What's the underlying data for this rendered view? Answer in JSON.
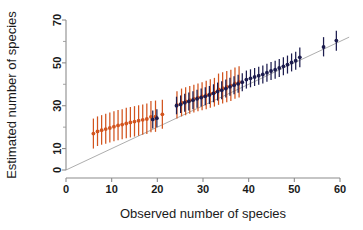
{
  "chart_data": {
    "type": "scatter",
    "title": "",
    "subtitle": "",
    "xlabel": "Observed number of species",
    "ylabel": "Estimated number of species",
    "xlim": [
      0,
      62
    ],
    "ylim": [
      0,
      72
    ],
    "xticks": [
      0,
      10,
      20,
      30,
      40,
      50,
      60
    ],
    "xticklabels": [
      "0",
      "10",
      "20",
      "30",
      "40",
      "50",
      "60"
    ],
    "yticks": [
      0,
      10,
      30,
      50,
      70
    ],
    "yticklabels": [
      "0",
      "10",
      "30",
      "50",
      "70"
    ],
    "yminorticks": [
      20,
      40,
      60
    ],
    "grid": false,
    "legend_position": "none",
    "annotations": [
      {
        "kind": "reference-line",
        "label": "1:1 identity line",
        "from": [
          0,
          0
        ],
        "to": [
          62,
          62
        ]
      }
    ],
    "colors": {
      "series_orange": "#D2541E",
      "series_navy": "#1C1C4E",
      "reference_line": "#aeaeae",
      "axis": "#8c8c8c",
      "background": "#ffffff"
    },
    "error_bar_style": "vertical-interval-with-central-point",
    "series": [
      {
        "name": "orange-estimator",
        "color": "#D2541E",
        "marker": "filled-circle",
        "points": [
          {
            "x": 6.0,
            "y": 17.0,
            "ylow": 10.0,
            "yhigh": 24.0
          },
          {
            "x": 6.9,
            "y": 18.0,
            "ylow": 11.2,
            "yhigh": 25.0
          },
          {
            "x": 7.8,
            "y": 18.6,
            "ylow": 11.8,
            "yhigh": 25.6
          },
          {
            "x": 8.7,
            "y": 19.1,
            "ylow": 12.3,
            "yhigh": 26.2
          },
          {
            "x": 9.6,
            "y": 19.6,
            "ylow": 12.8,
            "yhigh": 26.8
          },
          {
            "x": 10.5,
            "y": 20.2,
            "ylow": 13.4,
            "yhigh": 27.4
          },
          {
            "x": 11.4,
            "y": 20.8,
            "ylow": 13.9,
            "yhigh": 28.0
          },
          {
            "x": 12.3,
            "y": 21.2,
            "ylow": 14.3,
            "yhigh": 28.4
          },
          {
            "x": 13.2,
            "y": 21.7,
            "ylow": 14.8,
            "yhigh": 29.0
          },
          {
            "x": 14.1,
            "y": 22.2,
            "ylow": 15.2,
            "yhigh": 29.4
          },
          {
            "x": 15.0,
            "y": 22.6,
            "ylow": 15.6,
            "yhigh": 29.8
          },
          {
            "x": 15.9,
            "y": 23.0,
            "ylow": 16.0,
            "yhigh": 30.2
          },
          {
            "x": 16.8,
            "y": 23.4,
            "ylow": 16.4,
            "yhigh": 30.6
          },
          {
            "x": 17.7,
            "y": 23.8,
            "ylow": 16.8,
            "yhigh": 31.0
          },
          {
            "x": 18.6,
            "y": 24.8,
            "ylow": 17.6,
            "yhigh": 32.2
          },
          {
            "x": 19.6,
            "y": 24.9,
            "ylow": 17.8,
            "yhigh": 32.4
          },
          {
            "x": 21.1,
            "y": 26.0,
            "ylow": 19.2,
            "yhigh": 32.8
          },
          {
            "x": 24.3,
            "y": 30.4,
            "ylow": 24.0,
            "yhigh": 36.8
          },
          {
            "x": 25.3,
            "y": 31.4,
            "ylow": 25.0,
            "yhigh": 38.0
          },
          {
            "x": 26.2,
            "y": 32.0,
            "ylow": 25.6,
            "yhigh": 38.6
          },
          {
            "x": 27.1,
            "y": 32.6,
            "ylow": 26.2,
            "yhigh": 39.2
          },
          {
            "x": 28.0,
            "y": 33.2,
            "ylow": 26.8,
            "yhigh": 39.8
          },
          {
            "x": 28.9,
            "y": 33.8,
            "ylow": 27.4,
            "yhigh": 40.4
          },
          {
            "x": 29.8,
            "y": 34.3,
            "ylow": 27.9,
            "yhigh": 41.0
          },
          {
            "x": 30.7,
            "y": 34.9,
            "ylow": 28.4,
            "yhigh": 41.6
          },
          {
            "x": 31.6,
            "y": 35.6,
            "ylow": 29.0,
            "yhigh": 42.4
          },
          {
            "x": 32.5,
            "y": 36.2,
            "ylow": 29.6,
            "yhigh": 43.0
          },
          {
            "x": 33.4,
            "y": 37.6,
            "ylow": 30.4,
            "yhigh": 45.0
          },
          {
            "x": 34.3,
            "y": 38.2,
            "ylow": 31.0,
            "yhigh": 45.6
          },
          {
            "x": 35.2,
            "y": 38.8,
            "ylow": 31.6,
            "yhigh": 46.2
          },
          {
            "x": 36.1,
            "y": 39.4,
            "ylow": 32.2,
            "yhigh": 46.8
          },
          {
            "x": 37.0,
            "y": 40.4,
            "ylow": 33.2,
            "yhigh": 47.8
          },
          {
            "x": 37.9,
            "y": 41.0,
            "ylow": 33.8,
            "yhigh": 48.4
          }
        ]
      },
      {
        "name": "navy-estimator",
        "color": "#1C1C4E",
        "marker": "filled-circle",
        "points": [
          {
            "x": 19.0,
            "y": 23.6,
            "ylow": 19.4,
            "yhigh": 27.8
          },
          {
            "x": 19.9,
            "y": 24.2,
            "ylow": 20.0,
            "yhigh": 28.4
          },
          {
            "x": 24.2,
            "y": 30.0,
            "ylow": 26.0,
            "yhigh": 34.2
          },
          {
            "x": 25.1,
            "y": 30.6,
            "ylow": 26.6,
            "yhigh": 34.8
          },
          {
            "x": 26.0,
            "y": 31.4,
            "ylow": 27.2,
            "yhigh": 35.6
          },
          {
            "x": 26.9,
            "y": 32.0,
            "ylow": 27.8,
            "yhigh": 36.2
          },
          {
            "x": 27.8,
            "y": 32.6,
            "ylow": 28.4,
            "yhigh": 36.8
          },
          {
            "x": 28.7,
            "y": 33.2,
            "ylow": 29.0,
            "yhigh": 37.4
          },
          {
            "x": 29.6,
            "y": 33.8,
            "ylow": 29.6,
            "yhigh": 38.0
          },
          {
            "x": 30.5,
            "y": 34.4,
            "ylow": 30.2,
            "yhigh": 38.6
          },
          {
            "x": 31.4,
            "y": 35.0,
            "ylow": 30.8,
            "yhigh": 39.2
          },
          {
            "x": 32.3,
            "y": 35.8,
            "ylow": 31.6,
            "yhigh": 40.0
          },
          {
            "x": 33.2,
            "y": 36.6,
            "ylow": 32.4,
            "yhigh": 40.8
          },
          {
            "x": 34.1,
            "y": 37.2,
            "ylow": 33.0,
            "yhigh": 41.4
          },
          {
            "x": 35.0,
            "y": 38.0,
            "ylow": 33.8,
            "yhigh": 42.2
          },
          {
            "x": 35.9,
            "y": 38.8,
            "ylow": 34.6,
            "yhigh": 43.0
          },
          {
            "x": 36.8,
            "y": 39.6,
            "ylow": 35.4,
            "yhigh": 43.8
          },
          {
            "x": 37.7,
            "y": 40.2,
            "ylow": 36.0,
            "yhigh": 44.4
          },
          {
            "x": 38.6,
            "y": 41.0,
            "ylow": 36.8,
            "yhigh": 45.2
          },
          {
            "x": 39.5,
            "y": 42.2,
            "ylow": 38.0,
            "yhigh": 46.4
          },
          {
            "x": 40.4,
            "y": 42.8,
            "ylow": 38.6,
            "yhigh": 47.0
          },
          {
            "x": 41.3,
            "y": 43.4,
            "ylow": 39.2,
            "yhigh": 47.6
          },
          {
            "x": 42.2,
            "y": 44.0,
            "ylow": 39.8,
            "yhigh": 48.2
          },
          {
            "x": 43.1,
            "y": 44.6,
            "ylow": 40.4,
            "yhigh": 48.8
          },
          {
            "x": 44.0,
            "y": 45.4,
            "ylow": 41.2,
            "yhigh": 49.6
          },
          {
            "x": 44.9,
            "y": 46.2,
            "ylow": 42.0,
            "yhigh": 50.4
          },
          {
            "x": 45.8,
            "y": 46.8,
            "ylow": 42.6,
            "yhigh": 51.0
          },
          {
            "x": 46.7,
            "y": 47.6,
            "ylow": 43.4,
            "yhigh": 51.8
          },
          {
            "x": 47.6,
            "y": 48.4,
            "ylow": 44.2,
            "yhigh": 52.6
          },
          {
            "x": 48.5,
            "y": 49.2,
            "ylow": 45.0,
            "yhigh": 53.4
          },
          {
            "x": 49.4,
            "y": 50.2,
            "ylow": 46.0,
            "yhigh": 54.4
          },
          {
            "x": 50.3,
            "y": 51.0,
            "ylow": 46.8,
            "yhigh": 55.2
          },
          {
            "x": 51.2,
            "y": 52.6,
            "ylow": 48.0,
            "yhigh": 57.2
          },
          {
            "x": 56.4,
            "y": 57.4,
            "ylow": 53.0,
            "yhigh": 62.0
          },
          {
            "x": 59.2,
            "y": 60.4,
            "ylow": 55.6,
            "yhigh": 65.0
          }
        ]
      }
    ]
  }
}
